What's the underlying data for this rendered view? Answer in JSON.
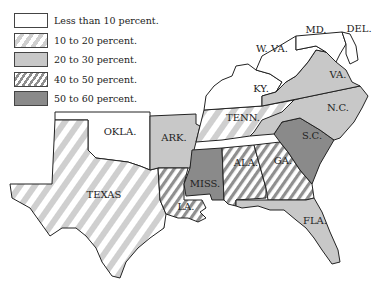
{
  "legend": {
    "items": [
      {
        "label": "Less than 10 percent.",
        "pattern": "white"
      },
      {
        "label": "10 to 20 percent.",
        "pattern": "light-hatch"
      },
      {
        "label": "20 to 30 percent.",
        "pattern": "light-gray"
      },
      {
        "label": "40 to 50 percent.",
        "pattern": "dark-hatch"
      },
      {
        "label": "50 to 60 percent.",
        "pattern": "dark-gray"
      }
    ]
  },
  "colors": {
    "white": "#ffffff",
    "light_gray": "#c8c8c8",
    "dark_gray": "#8a8a8a",
    "hatch_light": "#cfcfcf",
    "hatch_dark": "#8f8f8f",
    "outline": "#222222"
  },
  "states": [
    {
      "abbr": "MD.",
      "category": "Less than 10 percent."
    },
    {
      "abbr": "DEL.",
      "category": "Less than 10 percent."
    },
    {
      "abbr": "W. VA.",
      "category": "Less than 10 percent."
    },
    {
      "abbr": "KY.",
      "category": "Less than 10 percent."
    },
    {
      "abbr": "OKLA.",
      "category": "Less than 10 percent."
    },
    {
      "abbr": "TEXAS",
      "category": "10 to 20 percent."
    },
    {
      "abbr": "TENN.",
      "category": "10 to 20 percent."
    },
    {
      "abbr": "VA.",
      "category": "20 to 30 percent."
    },
    {
      "abbr": "N.C.",
      "category": "20 to 30 percent."
    },
    {
      "abbr": "ARK.",
      "category": "20 to 30 percent."
    },
    {
      "abbr": "FLA.",
      "category": "20 to 30 percent."
    },
    {
      "abbr": "LA.",
      "category": "40 to 50 percent."
    },
    {
      "abbr": "ALA.",
      "category": "40 to 50 percent."
    },
    {
      "abbr": "GA.",
      "category": "40 to 50 percent."
    },
    {
      "abbr": "MISS.",
      "category": "50 to 60 percent."
    },
    {
      "abbr": "S.C.",
      "category": "50 to 60 percent."
    }
  ],
  "labels": {
    "md": "MD.",
    "del": "DEL.",
    "wva": "W. VA.",
    "va": "VA.",
    "ky": "KY.",
    "nc": "N.C.",
    "tenn": "TENN.",
    "okla": "OKLA.",
    "ark": "ARK.",
    "sc": "S.C.",
    "texas": "TEXAS",
    "miss": "MISS.",
    "ala": "ALA.",
    "ga": "GA.",
    "la": "LA.",
    "fla": "FLA."
  }
}
